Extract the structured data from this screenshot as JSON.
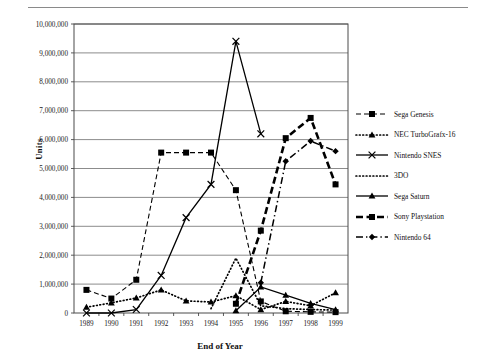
{
  "chart_data": {
    "type": "line",
    "title": "",
    "xlabel": "End of Year",
    "ylabel": "Units",
    "categories": [
      "1989",
      "1990",
      "1991",
      "1992",
      "1993",
      "1994",
      "1995",
      "1996",
      "1997",
      "1998",
      "1999"
    ],
    "ylim": [
      0,
      10000000
    ],
    "ytick_values": [
      0,
      1000000,
      2000000,
      3000000,
      4000000,
      5000000,
      6000000,
      7000000,
      8000000,
      9000000,
      10000000
    ],
    "ytick_labels": [
      "0",
      "1,000,000",
      "2,000,000",
      "3,000,000",
      "4,000,000",
      "5,000,000",
      "6,000,000",
      "7,000,000",
      "8,000,000",
      "9,000,000",
      "10,000,000"
    ],
    "grid": true,
    "grid_axis": "y",
    "legend_position": "right",
    "series": [
      {
        "name": "Sega Genesis",
        "marker": "square",
        "line_style": "dashed",
        "color": "#000000",
        "values": [
          800000,
          500000,
          1150000,
          5550000,
          5550000,
          5550000,
          4250000,
          400000,
          60000,
          40000,
          30000
        ]
      },
      {
        "name": "NEC TurboGrafx-16",
        "marker": "triangle",
        "line_style": "dotted",
        "color": "#000000",
        "values": [
          200000,
          350000,
          520000,
          800000,
          420000,
          380000,
          600000,
          120000,
          400000,
          250000,
          700000
        ]
      },
      {
        "name": "Nintendo SNES",
        "marker": "x",
        "line_style": "solid",
        "color": "#000000",
        "values": [
          0,
          0,
          120000,
          1300000,
          3300000,
          4450000,
          9400000,
          6200000,
          null,
          null,
          null
        ]
      },
      {
        "name": "3DO",
        "marker": "none",
        "line_style": "dotted",
        "color": "#000000",
        "values": [
          null,
          null,
          null,
          null,
          null,
          150000,
          1900000,
          250000,
          150000,
          120000,
          100000
        ]
      },
      {
        "name": "Sega Saturn",
        "marker": "triangle",
        "line_style": "solid",
        "color": "#000000",
        "values": [
          null,
          null,
          null,
          null,
          null,
          null,
          80000,
          900000,
          620000,
          330000,
          120000
        ]
      },
      {
        "name": "Sony Playstation",
        "marker": "square",
        "line_style": "thick-dashed",
        "color": "#000000",
        "values": [
          null,
          null,
          null,
          null,
          null,
          null,
          320000,
          2850000,
          6050000,
          6750000,
          4450000
        ]
      },
      {
        "name": "Nintendo 64",
        "marker": "diamond",
        "line_style": "dash-dot",
        "color": "#000000",
        "values": [
          null,
          null,
          null,
          null,
          null,
          null,
          null,
          1050000,
          5250000,
          5950000,
          5600000
        ]
      }
    ]
  },
  "legend": {
    "items": [
      {
        "label": "Sega Genesis"
      },
      {
        "label": "NEC TurboGrafx-16"
      },
      {
        "label": "Nintendo SNES"
      },
      {
        "label": "3DO"
      },
      {
        "label": "Sega Saturn"
      },
      {
        "label": "Sony Playstation"
      },
      {
        "label": "Nintendo 64"
      }
    ]
  },
  "axes": {
    "x_title": "End of Year",
    "y_title": "Units"
  }
}
